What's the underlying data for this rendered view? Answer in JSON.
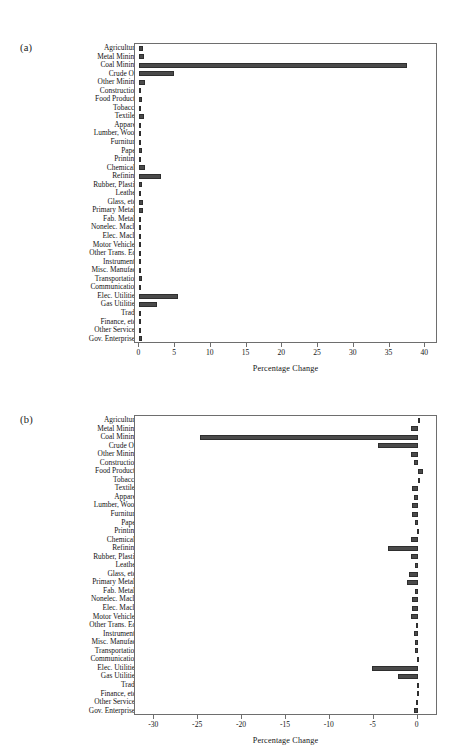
{
  "figure": {
    "categories": [
      "Agriculture",
      "Metal Mining",
      "Coal Mining",
      "Crude Oil",
      "Other Mining",
      "Construction",
      "Food Products",
      "Tobacco",
      "Textiles",
      "Apparel",
      "Lumber, Wood",
      "Furniture",
      "Paper",
      "Printing",
      "Chemicals",
      "Refining",
      "Rubber, Plastic",
      "Leather",
      "Glass, etc.",
      "Primary Metals",
      "Fab. Metals",
      "Nonelec. Mach.",
      "Elec. Mach.",
      "Motor Vehicles",
      "Other Trans. Eq.",
      "Instruments",
      "Misc. Manufac.",
      "Transportation",
      "Communication",
      "Elec. Utilities",
      "Gas Utilities",
      "Trade",
      "Finance, etc.",
      "Other Services",
      "Gov. Enterprises"
    ],
    "bar_color": "#4a4a4a"
  },
  "chart_data": [
    {
      "panel": "(a)",
      "type": "bar",
      "orientation": "horizontal",
      "title": "",
      "xlabel": "Percentage Change",
      "ylabel": "",
      "xlim": [
        -0.6,
        41.5
      ],
      "xticks": [
        0,
        5,
        10,
        15,
        20,
        25,
        30,
        35,
        40
      ],
      "xticklabels": [
        "0",
        "5",
        "10",
        "15",
        "20",
        "25",
        "30",
        "35",
        "40"
      ],
      "grid": false,
      "legend": "none",
      "categories": [
        "Agriculture",
        "Metal Mining",
        "Coal Mining",
        "Crude Oil",
        "Other Mining",
        "Construction",
        "Food Products",
        "Tobacco",
        "Textiles",
        "Apparel",
        "Lumber, Wood",
        "Furniture",
        "Paper",
        "Printing",
        "Chemicals",
        "Refining",
        "Rubber, Plastic",
        "Leather",
        "Glass, etc.",
        "Primary Metals",
        "Fab. Metals",
        "Nonelec. Mach.",
        "Elec. Mach.",
        "Motor Vehicles",
        "Other Trans. Eq.",
        "Instruments",
        "Misc. Manufac.",
        "Transportation",
        "Communication",
        "Elec. Utilities",
        "Gas Utilities",
        "Trade",
        "Finance, etc.",
        "Other Services",
        "Gov. Enterprises"
      ],
      "values": [
        0.55,
        0.62,
        37.4,
        4.8,
        0.75,
        0.3,
        0.32,
        0.3,
        0.62,
        0.18,
        0.22,
        0.2,
        0.4,
        0.22,
        0.75,
        3.05,
        0.42,
        0.12,
        0.55,
        0.58,
        0.25,
        0.2,
        0.18,
        0.2,
        0.2,
        0.18,
        0.14,
        0.35,
        0.3,
        5.45,
        2.45,
        0.15,
        0.2,
        0.25,
        0.45
      ]
    },
    {
      "panel": "(b)",
      "type": "bar",
      "orientation": "horizontal",
      "title": "",
      "xlabel": "Percentage Change",
      "ylabel": "",
      "xlim": [
        -32.2,
        2.1
      ],
      "xticks": [
        -30,
        -25,
        -20,
        -15,
        -10,
        -5,
        0
      ],
      "xticklabels": [
        "-30",
        "-25",
        "-20",
        "-15",
        "-10",
        "-5",
        "0"
      ],
      "grid": false,
      "legend": "none",
      "categories": [
        "Agriculture",
        "Metal Mining",
        "Coal Mining",
        "Crude Oil",
        "Other Mining",
        "Construction",
        "Food Products",
        "Tobacco",
        "Textiles",
        "Apparel",
        "Lumber, Wood",
        "Furniture",
        "Paper",
        "Printing",
        "Chemicals",
        "Refining",
        "Rubber, Plastic",
        "Leather",
        "Glass, etc.",
        "Primary Metals",
        "Fab. Metals",
        "Nonelec. Mach.",
        "Elec. Mach.",
        "Motor Vehicles",
        "Other Trans. Eq.",
        "Instruments",
        "Misc. Manufac.",
        "Transportation",
        "Communication",
        "Elec. Utilities",
        "Gas Utilities",
        "Trade",
        "Finance, etc.",
        "Other Services",
        "Gov. Enterprises"
      ],
      "values": [
        0.15,
        -0.75,
        -24.8,
        -4.55,
        -0.8,
        -0.45,
        0.6,
        0.25,
        -0.6,
        -0.45,
        -0.65,
        -0.6,
        -0.3,
        -0.05,
        -0.75,
        -3.35,
        -0.7,
        -0.25,
        -0.95,
        -1.15,
        -0.35,
        -0.65,
        -0.6,
        -0.7,
        -0.2,
        -0.4,
        -0.3,
        -0.35,
        -0.08,
        -5.2,
        -2.2,
        -0.1,
        -0.12,
        -0.15,
        -0.4
      ]
    }
  ]
}
